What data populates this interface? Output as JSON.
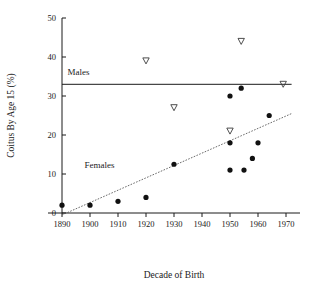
{
  "chart_data": {
    "type": "scatter",
    "title": "",
    "xlabel": "Decade of Birth",
    "ylabel": "Coitus By Age 15 (%)",
    "xlim": [
      1885,
      1975
    ],
    "ylim": [
      0,
      50
    ],
    "xticks": [
      1890,
      1900,
      1910,
      1920,
      1930,
      1940,
      1950,
      1960,
      1970
    ],
    "xticklabels": [
      "1890",
      "1900",
      "1910",
      "1920",
      "1930",
      "1940",
      "1950",
      "1960",
      "1970"
    ],
    "yticks": [
      0,
      10,
      20,
      30,
      40,
      50
    ],
    "yticklabels": [
      "0",
      "10",
      "20",
      "30",
      "40",
      "50"
    ],
    "grid": false,
    "legend_position": "inline-annotations",
    "annotations": [
      {
        "text": "Males",
        "x": 1892,
        "y": 35.5
      },
      {
        "text": "Females",
        "x": 1898,
        "y": 11.5
      }
    ],
    "series": [
      {
        "name": "Males",
        "marker": "open-triangle-down",
        "points": [
          {
            "x": 1920,
            "y": 39
          },
          {
            "x": 1930,
            "y": 27
          },
          {
            "x": 1950,
            "y": 21
          },
          {
            "x": 1954,
            "y": 44
          },
          {
            "x": 1969,
            "y": 33
          }
        ],
        "fit_line": {
          "type": "horizontal",
          "value": 33,
          "x_start": 1890,
          "x_end": 1972,
          "style": "solid"
        }
      },
      {
        "name": "Females",
        "marker": "filled-circle",
        "points": [
          {
            "x": 1890,
            "y": 2
          },
          {
            "x": 1900,
            "y": 2
          },
          {
            "x": 1910,
            "y": 3
          },
          {
            "x": 1920,
            "y": 4
          },
          {
            "x": 1930,
            "y": 12.5
          },
          {
            "x": 1950,
            "y": 30
          },
          {
            "x": 1950,
            "y": 18
          },
          {
            "x": 1950,
            "y": 11
          },
          {
            "x": 1954,
            "y": 32
          },
          {
            "x": 1955,
            "y": 11
          },
          {
            "x": 1958,
            "y": 14
          },
          {
            "x": 1960,
            "y": 18
          },
          {
            "x": 1964,
            "y": 25
          }
        ],
        "fit_line": {
          "type": "linear",
          "x_start": 1890,
          "y_start": -0.5,
          "x_end": 1972,
          "y_end": 25.5,
          "style": "dotted"
        }
      }
    ]
  }
}
